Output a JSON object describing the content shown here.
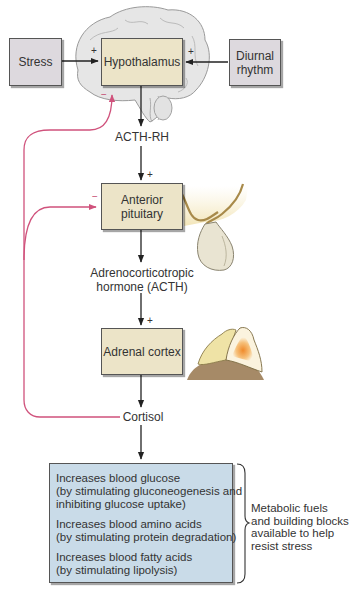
{
  "diagram": {
    "nodes": {
      "stress": {
        "label": "Stress"
      },
      "hypothalamus": {
        "label": "Hypothalamus"
      },
      "diurnal_rhythm": {
        "label_lines": [
          "Diurnal",
          "rhythm"
        ]
      },
      "anterior_pituitary": {
        "label_lines": [
          "Anterior",
          "pituitary"
        ]
      },
      "adrenal_cortex": {
        "label": "Adrenal cortex"
      }
    },
    "hormones": {
      "acth_rh": {
        "label": "ACTH-RH"
      },
      "acth": {
        "label_lines": [
          "Adrenocorticotropic",
          "hormone (ACTH)"
        ]
      },
      "cortisol": {
        "label": "Cortisol"
      }
    },
    "signs": {
      "stress_to_hypothalamus": "+",
      "diurnal_to_hypothalamus": "+",
      "acthrh_to_pituitary": "+",
      "acth_to_adrenal": "+",
      "feedback_hypothalamus": "−",
      "feedback_pituitary": "−"
    },
    "effects": [
      {
        "lines": [
          "Increases blood glucose",
          "(by stimulating gluconeogenesis and",
          "inhibiting glucose uptake)"
        ]
      },
      {
        "lines": [
          "Increases blood amino acids",
          "(by stimulating protein degradation)"
        ]
      },
      {
        "lines": [
          "Increases blood fatty acids",
          "(by stimulating lipolysis)"
        ]
      }
    ],
    "outcome_note": {
      "lines": [
        "Metabolic fuels",
        "and building blocks",
        "available to help",
        "resist stress"
      ]
    },
    "colors": {
      "feedback_line": "#d0527c",
      "gray_box": "#ddd9de",
      "tan_box": "#ece4c8",
      "effects_box": "#c9dbe8",
      "brain": "#e4e4e4",
      "adrenal_cortex_outer": "#efe3a6",
      "adrenal_medulla": "#f19a3e",
      "kidney": "#a68a67"
    }
  }
}
